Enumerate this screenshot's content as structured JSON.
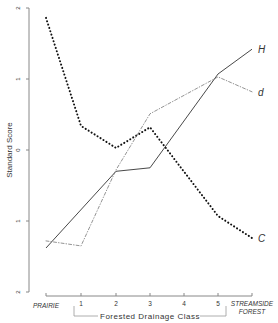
{
  "chart_data": {
    "type": "line",
    "title": "",
    "xlabel": "Forested Drainage Class",
    "ylabel": "Standard Score",
    "categories": [
      "PRAIRIE",
      "1",
      "2",
      "3",
      "4",
      "5",
      "STREAMSIDE FOREST"
    ],
    "ylim": [
      -2,
      2
    ],
    "yticks": [
      "2",
      "1",
      "0",
      "-1",
      "-2"
    ],
    "grid": false,
    "series": [
      {
        "name": "C",
        "style": "dotted",
        "x": [
          "PRAIRIE",
          "1",
          "2",
          "3",
          "5",
          "STREAMSIDE FOREST"
        ],
        "values": [
          1.86,
          0.34,
          0.03,
          0.32,
          -0.93,
          -1.24
        ]
      },
      {
        "name": "H",
        "style": "solid",
        "x": [
          "PRAIRIE",
          "2",
          "3",
          "5",
          "STREAMSIDE FOREST"
        ],
        "values": [
          -1.38,
          -0.3,
          -0.25,
          1.07,
          1.42
        ]
      },
      {
        "name": "d",
        "style": "dash-dot",
        "x": [
          "PRAIRIE",
          "1",
          "2",
          "3",
          "5",
          "STREAMSIDE FOREST"
        ],
        "values": [
          -1.28,
          -1.35,
          -0.28,
          0.51,
          1.03,
          0.82
        ]
      }
    ],
    "axis_labels": {
      "prairie": "PRAIRIE",
      "streamside_line1": "STREAMSIDE",
      "streamside_line2": "FOREST"
    }
  }
}
